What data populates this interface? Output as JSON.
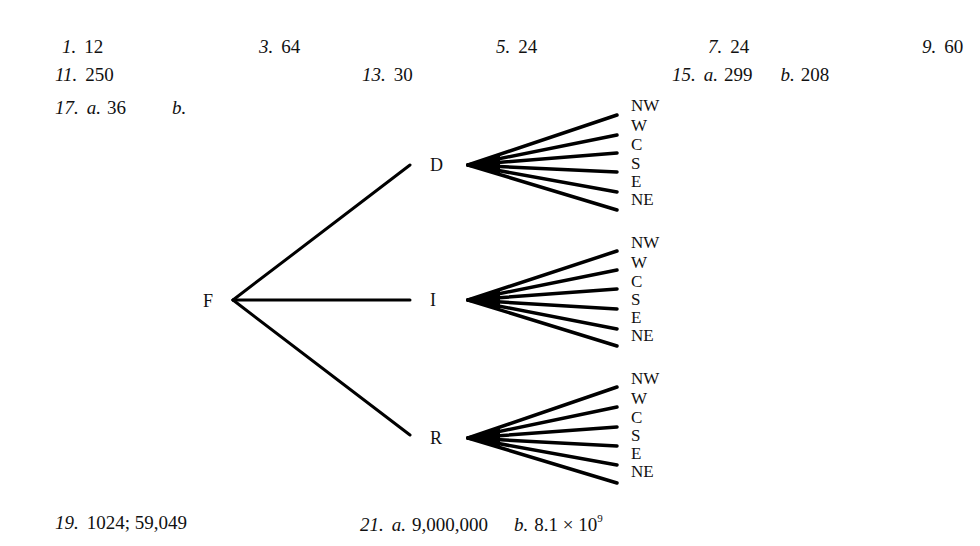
{
  "answers": {
    "a1": {
      "num": "1.",
      "value": "12"
    },
    "a3": {
      "num": "3.",
      "value": "64"
    },
    "a5": {
      "num": "5.",
      "value": "24"
    },
    "a7": {
      "num": "7.",
      "value": "24"
    },
    "a9": {
      "num": "9.",
      "value": "60"
    },
    "a11": {
      "num": "11.",
      "value": "250"
    },
    "a13": {
      "num": "13.",
      "value": "30"
    },
    "a15": {
      "num": "15.",
      "a_label": "a.",
      "a_value": "299",
      "b_label": "b.",
      "b_value": "208"
    },
    "a17": {
      "num": "17.",
      "a_label": "a.",
      "a_value": "36",
      "b_label": "b."
    },
    "a19": {
      "num": "19.",
      "value": "1024; 59,049"
    },
    "a21": {
      "num": "21.",
      "a_label": "a.",
      "a_value": "9,000,000",
      "b_label": "b.",
      "b_value": "8.1 × 10",
      "b_exp": "9"
    }
  },
  "tree": {
    "root": "F",
    "branches": [
      {
        "label": "D",
        "leaves": [
          "NW",
          "W",
          "C",
          "S",
          "E",
          "NE"
        ]
      },
      {
        "label": "I",
        "leaves": [
          "NW",
          "W",
          "C",
          "S",
          "E",
          "NE"
        ]
      },
      {
        "label": "R",
        "leaves": [
          "NW",
          "W",
          "C",
          "S",
          "E",
          "NE"
        ]
      }
    ]
  }
}
